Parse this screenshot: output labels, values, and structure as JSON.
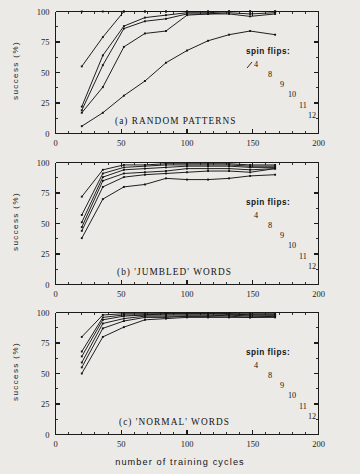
{
  "figure": {
    "xlabel": "number of training cycles",
    "ylabel": "success (%)",
    "legend_title": "spin flips:",
    "legend_labels": [
      "4",
      "8",
      "9",
      "10",
      "11",
      "12"
    ],
    "x_ticks": [
      "0",
      "50",
      "100",
      "150",
      "200"
    ],
    "y_ticks": [
      "0",
      "25",
      "50",
      "75",
      "100"
    ],
    "captions": {
      "a": "(a) RANDOM PATTERNS",
      "b": "(b) 'JUMBLED' WORDS",
      "c": "(c) 'NORMAL' WORDS"
    },
    "colors": {
      "ink": "#141414",
      "paper": "#eceae6"
    }
  },
  "chart_data": [
    {
      "type": "line",
      "title": "(a) RANDOM PATTERNS",
      "xlabel": "number of training cycles",
      "ylabel": "success (%)",
      "xlim": [
        0,
        200
      ],
      "ylim": [
        0,
        100
      ],
      "xticks": [
        0,
        50,
        100,
        150,
        200
      ],
      "yticks": [
        0,
        25,
        50,
        75,
        100
      ],
      "grid": false,
      "legend_title": "spin flips:",
      "legend_position": "inside-right",
      "series": [
        {
          "name": "4",
          "x": [
            20,
            36,
            52,
            68,
            84,
            100,
            116,
            132,
            148,
            167
          ],
          "y": [
            100,
            100,
            100,
            100,
            100,
            100,
            100,
            100,
            100,
            100
          ]
        },
        {
          "name": "8",
          "x": [
            20,
            36,
            52,
            68,
            84,
            100,
            116,
            132,
            148,
            167
          ],
          "y": [
            55,
            79,
            100,
            100,
            100,
            100,
            100,
            100,
            100,
            100
          ]
        },
        {
          "name": "9",
          "x": [
            20,
            36,
            52,
            68,
            84,
            100,
            116,
            132,
            148,
            167
          ],
          "y": [
            22,
            64,
            88,
            95,
            97,
            99,
            99,
            100,
            100,
            100
          ]
        },
        {
          "name": "10",
          "x": [
            20,
            36,
            52,
            68,
            84,
            100,
            116,
            132,
            148,
            167
          ],
          "y": [
            19,
            56,
            86,
            92,
            94,
            98,
            98,
            99,
            98,
            99
          ]
        },
        {
          "name": "11",
          "x": [
            20,
            36,
            52,
            68,
            84,
            100,
            116,
            132,
            148,
            167
          ],
          "y": [
            17,
            38,
            71,
            82,
            84,
            97,
            98,
            98,
            96,
            98
          ]
        },
        {
          "name": "12",
          "x": [
            20,
            36,
            52,
            68,
            84,
            100,
            116,
            132,
            148,
            167
          ],
          "y": [
            6,
            17,
            31,
            43,
            58,
            68,
            76,
            81,
            84,
            81
          ]
        }
      ]
    },
    {
      "type": "line",
      "title": "(b) 'JUMBLED' WORDS",
      "xlabel": "number of training cycles",
      "ylabel": "success (%)",
      "xlim": [
        0,
        200
      ],
      "ylim": [
        0,
        100
      ],
      "xticks": [
        0,
        50,
        100,
        150,
        200
      ],
      "yticks": [
        0,
        25,
        50,
        75,
        100
      ],
      "grid": false,
      "legend_title": "spin flips:",
      "legend_position": "inside-right",
      "series": [
        {
          "name": "4",
          "x": [
            20,
            36,
            52,
            68,
            84,
            100,
            116,
            132,
            148,
            167
          ],
          "y": [
            72,
            94,
            98,
            98,
            99,
            99,
            99,
            99,
            98,
            98
          ]
        },
        {
          "name": "8",
          "x": [
            20,
            36,
            52,
            68,
            84,
            100,
            116,
            132,
            148,
            167
          ],
          "y": [
            57,
            91,
            96,
            97,
            98,
            98,
            98,
            98,
            97,
            97
          ]
        },
        {
          "name": "9",
          "x": [
            20,
            36,
            52,
            68,
            84,
            100,
            116,
            132,
            148,
            167
          ],
          "y": [
            51,
            88,
            94,
            95,
            96,
            97,
            97,
            97,
            96,
            96
          ]
        },
        {
          "name": "10",
          "x": [
            20,
            36,
            52,
            68,
            84,
            100,
            116,
            132,
            148,
            167
          ],
          "y": [
            47,
            85,
            91,
            92,
            93,
            95,
            95,
            95,
            94,
            95
          ]
        },
        {
          "name": "11",
          "x": [
            20,
            36,
            52,
            68,
            84,
            100,
            116,
            132,
            148,
            167
          ],
          "y": [
            44,
            80,
            88,
            90,
            91,
            92,
            93,
            93,
            92,
            95
          ]
        },
        {
          "name": "12",
          "x": [
            20,
            36,
            52,
            68,
            84,
            100,
            116,
            132,
            148,
            167
          ],
          "y": [
            38,
            70,
            80,
            82,
            87,
            86,
            86,
            87,
            89,
            90
          ]
        }
      ]
    },
    {
      "type": "line",
      "title": "(c) 'NORMAL' WORDS",
      "xlabel": "number of training cycles",
      "ylabel": "success (%)",
      "xlim": [
        0,
        200
      ],
      "ylim": [
        0,
        100
      ],
      "xticks": [
        0,
        50,
        100,
        150,
        200
      ],
      "yticks": [
        0,
        25,
        50,
        75,
        100
      ],
      "grid": false,
      "legend_title": "spin flips:",
      "legend_position": "inside-right",
      "series": [
        {
          "name": "4",
          "x": [
            20,
            36,
            52,
            68,
            84,
            100,
            116,
            132,
            148,
            167
          ],
          "y": [
            80,
            98,
            99,
            99,
            99,
            99,
            99,
            99,
            99,
            99
          ]
        },
        {
          "name": "8",
          "x": [
            20,
            36,
            52,
            68,
            84,
            100,
            116,
            132,
            148,
            167
          ],
          "y": [
            68,
            96,
            98,
            98,
            99,
            99,
            99,
            99,
            98,
            98
          ]
        },
        {
          "name": "9",
          "x": [
            20,
            36,
            52,
            68,
            84,
            100,
            116,
            132,
            148,
            167
          ],
          "y": [
            64,
            94,
            97,
            98,
            98,
            98,
            98,
            98,
            98,
            98
          ]
        },
        {
          "name": "10",
          "x": [
            20,
            36,
            52,
            68,
            84,
            100,
            116,
            132,
            148,
            167
          ],
          "y": [
            59,
            91,
            95,
            97,
            97,
            97,
            97,
            98,
            97,
            97
          ]
        },
        {
          "name": "11",
          "x": [
            20,
            36,
            52,
            68,
            84,
            100,
            116,
            132,
            148,
            167
          ],
          "y": [
            55,
            87,
            93,
            96,
            96,
            97,
            97,
            97,
            96,
            97
          ]
        },
        {
          "name": "12",
          "x": [
            20,
            36,
            52,
            68,
            84,
            100,
            116,
            132,
            148,
            167
          ],
          "y": [
            50,
            80,
            88,
            94,
            95,
            96,
            96,
            96,
            96,
            96
          ]
        }
      ]
    }
  ]
}
